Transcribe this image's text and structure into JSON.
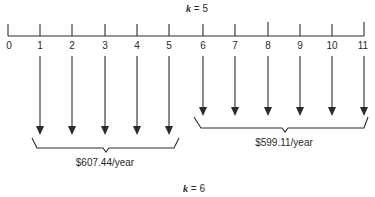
{
  "diagram": {
    "top_label": {
      "var": "k",
      "eq": "=",
      "value": "5"
    },
    "bottom_label": {
      "var": "k",
      "eq": "=",
      "value": "6"
    },
    "timeline": {
      "ticks": [
        "0",
        "1",
        "2",
        "3",
        "4",
        "5",
        "6",
        "7",
        "8",
        "9",
        "10",
        "11"
      ]
    },
    "groups": [
      {
        "name": "first-annuity",
        "periods": "1-5",
        "amount": "$607.44/year",
        "direction": "down"
      },
      {
        "name": "second-annuity",
        "periods": "6-11",
        "amount": "$599.11/year",
        "direction": "down"
      }
    ],
    "colors": {
      "ink": "#2a2a2a",
      "background": "#ffffff"
    }
  }
}
